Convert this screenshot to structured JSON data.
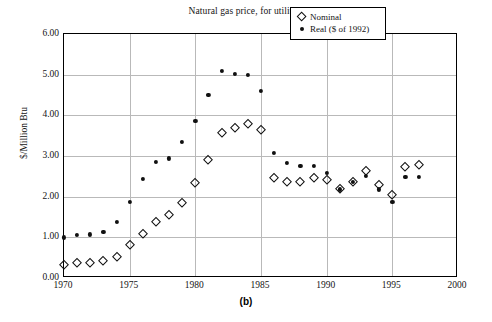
{
  "chart_data": {
    "type": "scatter",
    "title": "Natural gas price, for utilities",
    "panel_label": "(b)",
    "xlabel": "",
    "ylabel": "$/Million Btu",
    "xlim": [
      1970,
      2000
    ],
    "ylim": [
      0.0,
      6.0
    ],
    "xticks": [
      "1970",
      "1975",
      "1980",
      "1985",
      "1990",
      "1995",
      "2000"
    ],
    "xtick_values": [
      1970,
      1975,
      1980,
      1985,
      1990,
      1995,
      2000
    ],
    "yticks": [
      "0.00",
      "1.00",
      "2.00",
      "3.00",
      "4.00",
      "5.00",
      "6.00"
    ],
    "ytick_values": [
      0,
      1,
      2,
      3,
      4,
      5,
      6
    ],
    "grid": true,
    "legend_position": "top-right",
    "x": [
      1970,
      1971,
      1972,
      1973,
      1974,
      1975,
      1976,
      1977,
      1978,
      1979,
      1980,
      1981,
      1982,
      1983,
      1984,
      1985,
      1986,
      1987,
      1988,
      1989,
      1990,
      1991,
      1992,
      1993,
      1994,
      1995,
      1996,
      1997
    ],
    "series": [
      {
        "name": "Nominal",
        "marker": "open-diamond",
        "color": "#101010",
        "values": [
          0.33,
          0.36,
          0.38,
          0.41,
          0.51,
          0.81,
          1.09,
          1.37,
          1.54,
          1.84,
          2.33,
          2.91,
          3.56,
          3.68,
          3.79,
          3.63,
          2.46,
          2.36,
          2.35,
          2.46,
          2.41,
          2.19,
          2.37,
          2.63,
          2.28,
          2.03,
          2.72,
          2.78
        ]
      },
      {
        "name": "Real ($ of 1992)",
        "marker": "filled-circle",
        "color": "#101010",
        "values": [
          1.0,
          1.05,
          1.07,
          1.13,
          1.37,
          1.88,
          2.43,
          2.85,
          2.94,
          3.35,
          3.87,
          4.5,
          5.1,
          5.02,
          4.99,
          4.61,
          3.07,
          2.83,
          2.76,
          2.76,
          2.59,
          2.18,
          2.37,
          2.52,
          2.18,
          1.88,
          2.48,
          2.48
        ]
      }
    ]
  },
  "legend": {
    "entries": [
      {
        "label": "Nominal",
        "marker": "open-diamond"
      },
      {
        "label": "Real ($ of 1992)",
        "marker": "filled-circle"
      }
    ]
  }
}
